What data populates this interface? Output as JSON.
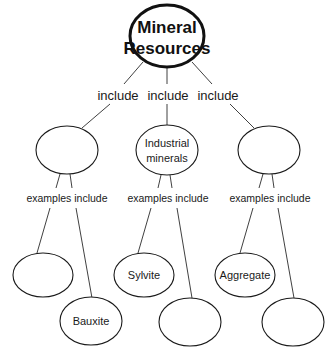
{
  "diagram": {
    "type": "concept-map",
    "root": {
      "line1": "Mineral",
      "line2": "Resources"
    },
    "links": {
      "include_left": "include",
      "include_middle": "include",
      "include_right": "include",
      "examples_left": "examples include",
      "examples_middle": "examples include",
      "examples_right": "examples include"
    },
    "level2": [
      {
        "id": "left",
        "line1": "",
        "line2": ""
      },
      {
        "id": "middle",
        "line1": "Industrial",
        "line2": "minerals"
      },
      {
        "id": "right",
        "line1": "",
        "line2": ""
      }
    ],
    "level3": [
      {
        "id": "left-a",
        "label": ""
      },
      {
        "id": "left-b",
        "label": "Bauxite"
      },
      {
        "id": "middle-a",
        "label": "Sylvite"
      },
      {
        "id": "middle-b",
        "label": ""
      },
      {
        "id": "right-a",
        "label": "Aggregate"
      },
      {
        "id": "right-b",
        "label": ""
      }
    ]
  }
}
